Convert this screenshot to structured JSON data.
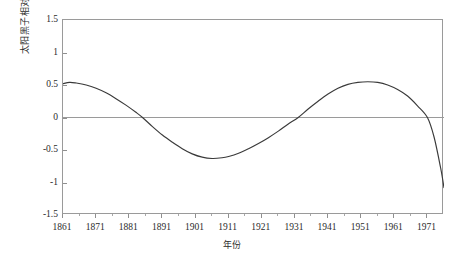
{
  "chart_data": {
    "type": "line",
    "title": "",
    "xlabel": "年份",
    "ylabel": "太阳黑子相对数",
    "xlim": [
      1861,
      1976
    ],
    "ylim": [
      -1.5,
      1.5
    ],
    "grid": false,
    "legend": "none",
    "xticks": [
      1861,
      1871,
      1881,
      1891,
      1901,
      1911,
      1921,
      1931,
      1941,
      1951,
      1961,
      1971
    ],
    "xtick_labels": [
      "1861",
      "1871",
      "1881",
      "1891",
      "1901",
      "1911",
      "1921",
      "1931",
      "1941",
      "1951",
      "1961",
      "1971"
    ],
    "xtick_minor_step": 5,
    "yticks": [
      1.5,
      1,
      0.5,
      0,
      -0.5,
      -1,
      -1.5
    ],
    "ytick_labels": [
      "1.5",
      "1",
      "0.5",
      "0",
      "-0.5",
      "-1",
      "-1.5"
    ],
    "zero_line": 0,
    "line_color": "#3a3a3a",
    "axis_color": "#9a9a9a",
    "zero_line_color": "#9a9a9a",
    "background_color": "#ffffff",
    "series": [
      {
        "name": "太阳黑子相对数",
        "x": [
          1861,
          1863,
          1865,
          1868,
          1871,
          1874,
          1877,
          1880,
          1883,
          1885,
          1888,
          1891,
          1894,
          1897,
          1900,
          1903,
          1906,
          1909,
          1911,
          1914,
          1917,
          1920,
          1923,
          1926,
          1929,
          1932,
          1935,
          1938,
          1941,
          1944,
          1947,
          1950,
          1953,
          1956,
          1959,
          1962,
          1965,
          1968,
          1971,
          1973,
          1975,
          1976
        ],
        "y": [
          0.52,
          0.54,
          0.53,
          0.5,
          0.45,
          0.38,
          0.29,
          0.19,
          0.08,
          0.0,
          -0.14,
          -0.27,
          -0.38,
          -0.48,
          -0.56,
          -0.61,
          -0.63,
          -0.62,
          -0.6,
          -0.55,
          -0.48,
          -0.4,
          -0.31,
          -0.21,
          -0.1,
          0.0,
          0.13,
          0.25,
          0.36,
          0.45,
          0.51,
          0.54,
          0.55,
          0.54,
          0.5,
          0.43,
          0.33,
          0.18,
          0.0,
          -0.3,
          -0.78,
          -1.08
        ]
      }
    ],
    "annotations": []
  }
}
